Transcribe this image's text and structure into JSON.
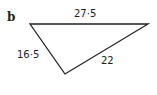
{
  "part_label": "b",
  "triangle": {
    "vertices": [
      [
        30,
        24
      ],
      [
        148,
        24
      ],
      [
        65,
        74
      ]
    ],
    "stroke": "#231f20",
    "sides": {
      "top": "27·5",
      "left": "16·5",
      "right": "22"
    }
  }
}
